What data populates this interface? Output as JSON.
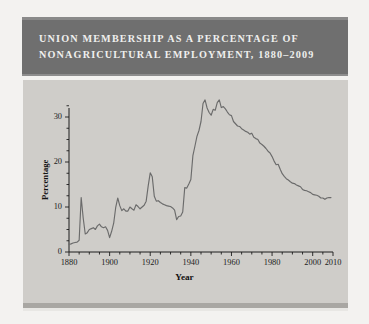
{
  "figure": {
    "title_lines": "UNION MEMBERSHIP AS A PERCENTAGE OF\nNONAGRICULTURAL EMPLOYMENT, 1880–2009",
    "banner_color": "#6f6f6f",
    "panel_color": "#cfcdc9",
    "line_color": "#6b6b6b",
    "page_color": "#f3f2f0"
  },
  "chart_data": {
    "type": "line",
    "title": "UNION MEMBERSHIP AS A PERCENTAGE OF NONAGRICULTURAL EMPLOYMENT, 1880–2009",
    "xlabel": "Year",
    "ylabel": "Percentage",
    "xlim": [
      1880,
      2010
    ],
    "ylim": [
      0,
      34
    ],
    "xticks": [
      1880,
      1900,
      1920,
      1940,
      1960,
      1980,
      2000,
      2010
    ],
    "xtick_labels": [
      "1880",
      "1900",
      "1920",
      "1940",
      "1960",
      "1980",
      "2000",
      "2010"
    ],
    "x_minor_tick_interval": 5,
    "yticks": [
      0,
      10,
      20,
      30
    ],
    "ytick_labels": [
      "0",
      "10",
      "20",
      "30"
    ],
    "y_minor_tick_interval": 2.5,
    "grid": false,
    "legend": "none",
    "series": [
      {
        "name": "Union membership (% of nonagricultural employment)",
        "x": [
          1880,
          1881,
          1882,
          1883,
          1884,
          1885,
          1886,
          1887,
          1888,
          1889,
          1890,
          1891,
          1892,
          1893,
          1894,
          1895,
          1896,
          1897,
          1898,
          1899,
          1900,
          1901,
          1902,
          1903,
          1904,
          1905,
          1906,
          1907,
          1908,
          1909,
          1910,
          1911,
          1912,
          1913,
          1914,
          1915,
          1916,
          1917,
          1918,
          1919,
          1920,
          1921,
          1922,
          1923,
          1924,
          1925,
          1926,
          1927,
          1928,
          1929,
          1930,
          1931,
          1932,
          1933,
          1934,
          1935,
          1936,
          1937,
          1938,
          1939,
          1940,
          1941,
          1942,
          1943,
          1944,
          1945,
          1946,
          1947,
          1948,
          1949,
          1950,
          1951,
          1952,
          1953,
          1954,
          1955,
          1956,
          1957,
          1958,
          1959,
          1960,
          1961,
          1962,
          1963,
          1964,
          1965,
          1966,
          1967,
          1968,
          1969,
          1970,
          1971,
          1972,
          1973,
          1974,
          1975,
          1976,
          1977,
          1978,
          1979,
          1980,
          1981,
          1982,
          1983,
          1984,
          1985,
          1986,
          1987,
          1988,
          1989,
          1990,
          1991,
          1992,
          1993,
          1994,
          1995,
          1996,
          1997,
          1998,
          1999,
          2000,
          2001,
          2002,
          2003,
          2004,
          2005,
          2006,
          2007,
          2008,
          2009
        ],
        "values": [
          1.7,
          1.8,
          2.0,
          2.1,
          2.2,
          2.6,
          12.1,
          7.5,
          4.0,
          4.3,
          5.0,
          5.2,
          5.4,
          5.0,
          5.8,
          6.2,
          5.6,
          5.4,
          5.6,
          4.8,
          3.2,
          4.6,
          6.4,
          9.9,
          12.0,
          10.3,
          9.2,
          9.6,
          9.1,
          9.1,
          10.0,
          9.6,
          9.3,
          10.5,
          10.1,
          9.6,
          10.0,
          10.4,
          11.3,
          14.7,
          17.6,
          16.7,
          12.4,
          11.3,
          11.4,
          11.0,
          10.7,
          10.5,
          10.3,
          10.2,
          10.1,
          9.8,
          9.3,
          7.2,
          7.9,
          8.0,
          8.9,
          14.3,
          14.2,
          15.1,
          16.1,
          21.4,
          23.5,
          25.7,
          27.0,
          29.0,
          33.0,
          33.8,
          32.0,
          31.0,
          30.4,
          31.7,
          31.5,
          33.2,
          33.8,
          32.1,
          32.3,
          31.8,
          31.1,
          30.5,
          30.3,
          29.0,
          28.5,
          28.0,
          27.9,
          27.4,
          27.1,
          26.8,
          26.6,
          26.2,
          26.4,
          25.5,
          25.2,
          25.0,
          24.2,
          23.9,
          23.5,
          23.0,
          22.4,
          22.0,
          21.2,
          20.2,
          19.4,
          19.5,
          18.4,
          17.4,
          16.8,
          16.3,
          16.0,
          15.6,
          15.3,
          15.2,
          14.9,
          14.7,
          14.5,
          13.9,
          13.7,
          13.6,
          13.4,
          13.2,
          12.8,
          12.7,
          12.6,
          12.4,
          12.0,
          12.0,
          11.7,
          12.0,
          12.1,
          12.1
        ]
      }
    ]
  },
  "axes": {
    "x_title": "Year",
    "y_title": "Percentage"
  }
}
